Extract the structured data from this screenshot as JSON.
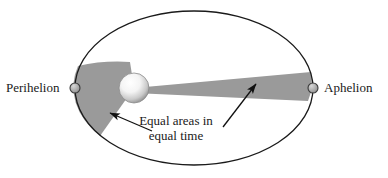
{
  "figure": {
    "name": "keplers-second-law-orbit-diagram",
    "labels": {
      "perihelion": "Perihelion",
      "aphelion": "Aphelion"
    },
    "caption": {
      "line1": "Equal areas in",
      "line2": "equal time"
    },
    "colors": {
      "background": "#ffffff",
      "orbit_stroke": "#1a1a1a",
      "sector_fill": "#9a9a9a",
      "marker_fill": "#8c8c8c",
      "marker_stroke": "#333333",
      "sun_core": "#ffffff",
      "sun_edge": "#8f8f8f",
      "arrow": "#111111",
      "text": "#1a1a1a"
    },
    "geometry": {
      "ellipse": {
        "cx": 194,
        "cy": 88,
        "rx": 119,
        "ry": 77
      },
      "sun": {
        "cx": 134,
        "cy": 88,
        "r": 15
      },
      "perihelion_marker": {
        "cx": 75,
        "cy": 88,
        "r": 5
      },
      "aphelion_marker": {
        "cx": 313,
        "cy": 88,
        "r": 5
      }
    },
    "annotations": {
      "left_sector_note": "Swept area near perihelion",
      "right_sector_note": "Swept area near aphelion",
      "arrow_left_target": "left-sector",
      "arrow_right_target": "right-sector"
    }
  }
}
